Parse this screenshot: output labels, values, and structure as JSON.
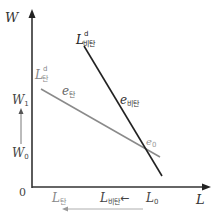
{
  "diagram": {
    "type": "labor-demand-elasticity",
    "axes": {
      "y_label": "W",
      "x_label": "L",
      "origin_label": "0"
    },
    "y_ticks": {
      "w1": {
        "main": "W",
        "sub": "1"
      },
      "w0": {
        "main": "W",
        "sub": "0"
      }
    },
    "curves": {
      "inelastic_demand": {
        "main": "L",
        "sup": "d",
        "sub": "비탄",
        "color": "#222222"
      },
      "elastic_demand": {
        "main": "L",
        "sup": "d",
        "sub": "탄",
        "color": "#8a8a8a"
      }
    },
    "points": {
      "e_elastic": {
        "main": "e",
        "sub": "탄"
      },
      "e_inelastic": {
        "main": "e",
        "sub": "비탄"
      },
      "e0": {
        "main": "e",
        "sub": "0"
      }
    },
    "x_ticks": {
      "l_elastic": {
        "main": "L",
        "sub": "탄"
      },
      "l_inelastic": {
        "main": "L",
        "sub": "비탄"
      },
      "arrow": "←",
      "l0": {
        "main": "L",
        "sub": "0"
      }
    },
    "colors": {
      "axis": "#333333",
      "inelastic": "#222222",
      "elastic": "#8a8a8a",
      "label_gray": "#777777"
    }
  }
}
